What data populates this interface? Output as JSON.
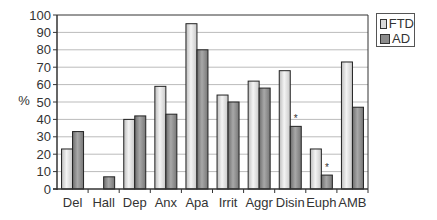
{
  "chart_data": {
    "type": "bar",
    "title": "",
    "xlabel": "",
    "ylabel": "%",
    "ylim": [
      0,
      100
    ],
    "yticks": [
      0,
      10,
      20,
      30,
      40,
      50,
      60,
      70,
      80,
      90,
      100
    ],
    "grid": true,
    "legend_position": "right-top",
    "categories": [
      "Del",
      "Hall",
      "Dep",
      "Anx",
      "Apa",
      "Irrit",
      "Aggr",
      "Disin",
      "Euph",
      "AMB"
    ],
    "series": [
      {
        "name": "FTD",
        "color": "#d9d9d9",
        "values": [
          23,
          0,
          40,
          59,
          95,
          54,
          62,
          68,
          23,
          73
        ]
      },
      {
        "name": "AD",
        "color": "#8c8c8c",
        "values": [
          33,
          7,
          42,
          43,
          80,
          50,
          58,
          36,
          8,
          47
        ]
      }
    ],
    "annotations": [
      {
        "category": "Disin",
        "series": "AD",
        "text": "*"
      },
      {
        "category": "Euph",
        "series": "AD",
        "text": "*"
      }
    ]
  },
  "legend": {
    "items": [
      {
        "label": "FTD",
        "color": "#d9d9d9"
      },
      {
        "label": "AD",
        "color": "#8c8c8c"
      }
    ]
  },
  "axis": {
    "ylabel": "%"
  }
}
